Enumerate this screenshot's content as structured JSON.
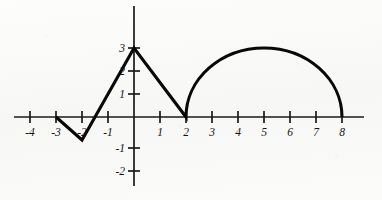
{
  "figure": {
    "background_color": "#fbfbfa",
    "curve_color": "#080808",
    "axis_color": "#1a1a1a",
    "width": 382,
    "height": 200
  },
  "axes": {
    "origin_px": {
      "x": 134,
      "y": 117
    },
    "x_scale_px_per_unit": 26,
    "y_scale_px_per_unit": 23,
    "x_axis": {
      "label": "",
      "min": -4.6,
      "max": 8.6,
      "tick_values": [
        -4,
        -3,
        -2,
        -1,
        1,
        2,
        3,
        4,
        5,
        6,
        7,
        8
      ],
      "tick_labels": [
        "-4",
        "-3",
        "-2",
        "-1",
        "1",
        "2",
        "3",
        "4",
        "5",
        "6",
        "7",
        "8"
      ]
    },
    "y_axis": {
      "label": "",
      "min": -2.9,
      "max": 3.9,
      "tick_values": [
        -2,
        -1,
        1,
        2,
        3
      ],
      "tick_labels": [
        "-2",
        "-1",
        "1",
        "2",
        "3"
      ]
    }
  },
  "chart_data": {
    "type": "line",
    "title": "",
    "xlabel": "",
    "ylabel": "",
    "xlim": [
      -4.6,
      8.6
    ],
    "ylim": [
      -2.9,
      3.9
    ],
    "grid": false,
    "legend": false,
    "x_ticks": [
      -4,
      -3,
      -2,
      -1,
      1,
      2,
      3,
      4,
      5,
      6,
      7,
      8
    ],
    "y_ticks": [
      -2,
      -1,
      1,
      2,
      3
    ],
    "series": [
      {
        "name": "piecewise curve",
        "segments": [
          {
            "kind": "line",
            "description": "descending segment from (-3,0) to (-2,-1)",
            "points": [
              [
                -3,
                0
              ],
              [
                -2,
                -1
              ]
            ]
          },
          {
            "kind": "line",
            "description": "ascending segment from (-2,-1) to (0,3)",
            "points": [
              [
                -2,
                -1
              ],
              [
                0,
                3
              ]
            ]
          },
          {
            "kind": "line",
            "description": "descending segment from (0,3) to (2,0)",
            "points": [
              [
                0,
                3
              ],
              [
                2,
                0
              ]
            ]
          },
          {
            "kind": "semicircle",
            "description": "upper semicircle of radius 3 centered at (5,0), from (2,0) to (8,0)",
            "center": [
              5,
              0
            ],
            "radius": 3,
            "x_start": 2,
            "x_end": 8,
            "above_axis": true
          }
        ],
        "key_points": [
          [
            -3,
            0
          ],
          [
            -2,
            -1
          ],
          [
            0,
            3
          ],
          [
            2,
            0
          ],
          [
            5,
            3
          ],
          [
            8,
            0
          ]
        ]
      }
    ]
  }
}
